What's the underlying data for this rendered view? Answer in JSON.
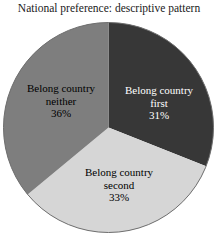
{
  "chart_data": {
    "type": "pie",
    "title": "National preference: descriptive pattern",
    "start_angle_deg": 0,
    "direction": "clockwise",
    "legend": "none",
    "background_color": "#ffffff",
    "outline_color": "#6e6e6e",
    "slices": [
      {
        "name": "Belong country first",
        "value": 31,
        "pct_label": "31%",
        "color": "#373737",
        "text_color": "#ffffff",
        "label_text": "Belong country\nfirst\n31%"
      },
      {
        "name": "Belong country second",
        "value": 33,
        "pct_label": "33%",
        "color": "#d6d6d6",
        "text_color": "#000000",
        "label_text": "Belong country\nsecond\n33%"
      },
      {
        "name": "Belong country neither",
        "value": 36,
        "pct_label": "36%",
        "color": "#7e7e7e",
        "text_color": "#000000",
        "label_text": "Belong country\nneither\n36%"
      }
    ]
  }
}
